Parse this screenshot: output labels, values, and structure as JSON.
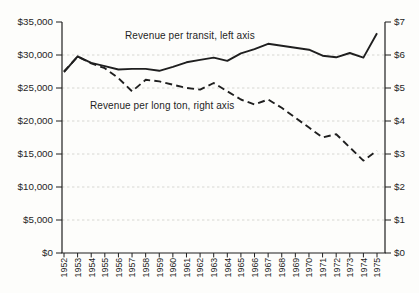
{
  "figure": {
    "colors": {
      "ink": "#1f1f1f",
      "gridline": "#d2d2cd",
      "background": "#fdfdfb"
    }
  },
  "chart_data": {
    "type": "line",
    "x_categories": [
      "1952",
      "1953",
      "1954",
      "1955",
      "1956",
      "1957",
      "1958",
      "1959",
      "1960",
      "1961",
      "1962",
      "1963",
      "1964",
      "1965",
      "1966",
      "1967",
      "1968",
      "1969",
      "1970",
      "1971",
      "1972",
      "1973",
      "1974",
      "1975"
    ],
    "series": [
      {
        "name": "Revenue per transit",
        "axis": "left",
        "line_style": "solid",
        "values": [
          27400,
          29800,
          28800,
          28300,
          27800,
          27900,
          27900,
          27600,
          28200,
          28900,
          29250,
          29600,
          29100,
          30250,
          30900,
          31700,
          31400,
          31100,
          30800,
          29900,
          29650,
          30300,
          29600,
          33300
        ]
      },
      {
        "name": "Revenue per long ton",
        "axis": "right",
        "line_style": "dashed",
        "values": [
          5.5,
          5.95,
          5.75,
          5.6,
          5.3,
          4.9,
          5.25,
          5.2,
          5.1,
          5.0,
          4.95,
          5.15,
          4.9,
          4.65,
          4.5,
          4.65,
          4.4,
          4.1,
          3.8,
          3.5,
          3.6,
          3.2,
          2.8,
          3.1
        ]
      }
    ],
    "left_axis": {
      "min": 0,
      "max": 35000,
      "step": 5000,
      "tick_labels": [
        "$0",
        "$5,000",
        "$10,000",
        "$15,000",
        "$20,000",
        "$25,000",
        "$30,000",
        "$35,000"
      ]
    },
    "right_axis": {
      "min": 0,
      "max": 7,
      "step": 1,
      "tick_labels": [
        "$0",
        "$1",
        "$2",
        "$3",
        "$4",
        "$5",
        "$6",
        "$7"
      ]
    },
    "annotations": [
      {
        "text": "Revenue per transit, left axis",
        "x": 125,
        "y": 30
      },
      {
        "text": "Revenue per long ton, right axis",
        "x": 90,
        "y": 100
      }
    ],
    "grid": "horizontal-dotted",
    "legend": "none"
  }
}
